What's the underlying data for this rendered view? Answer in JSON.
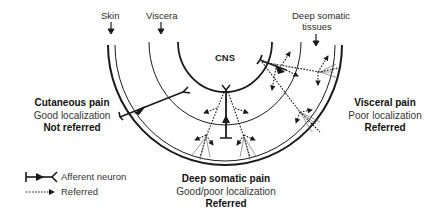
{
  "diagram": {
    "type": "referred-pain-schematic",
    "center_label": "CNS",
    "top_labels": {
      "skin": "Skin",
      "viscera": "Viscera",
      "deep_somatic_line1": "Deep somatic",
      "deep_somatic_line2": "tissues"
    },
    "pain_types": {
      "cutaneous": {
        "title": "Cutaneous pain",
        "localization": "Good localization",
        "referral": "Not referred"
      },
      "visceral": {
        "title": "Visceral pain",
        "localization": "Poor localization",
        "referral": "Referred"
      },
      "deep_somatic": {
        "title": "Deep somatic pain",
        "localization": "Good/poor localization",
        "referral": "Referred"
      }
    },
    "legend": {
      "afferent": "Afferent neuron",
      "referred": "Referred"
    },
    "colors": {
      "line": "#1a1a1a",
      "background": "#ffffff"
    }
  }
}
